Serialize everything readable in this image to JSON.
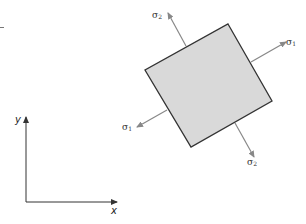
{
  "diagram": {
    "type": "principal-stress-element",
    "colors": {
      "element_fill": "#d9d9d9",
      "element_stroke": "#333333",
      "arrow": "#888888",
      "axis": "#333333"
    },
    "element": {
      "corners": [
        [
          228,
          24
        ],
        [
          272,
          101
        ],
        [
          191,
          147
        ],
        [
          145,
          70
        ]
      ]
    },
    "arrows": [
      {
        "id": "sigma2-top",
        "label": "σ",
        "sub": "2"
      },
      {
        "id": "sigma1-right",
        "label": "σ",
        "sub": "1"
      },
      {
        "id": "sigma1-left",
        "label": "σ",
        "sub": "1"
      },
      {
        "id": "sigma2-bottom",
        "label": "σ",
        "sub": "2"
      }
    ],
    "axes": {
      "x_label": "x",
      "y_label": "y"
    }
  }
}
